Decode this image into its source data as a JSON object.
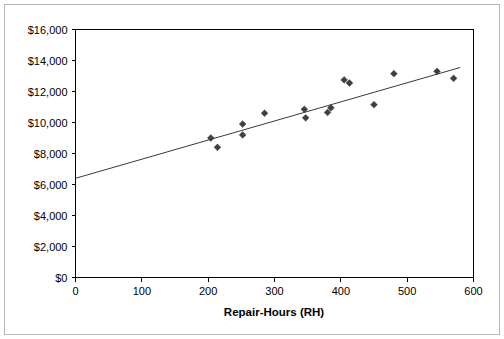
{
  "chart_data": {
    "type": "scatter",
    "title": "",
    "xlabel": "Repair-Hours (RH)",
    "ylabel": "",
    "xlim": [
      0,
      600
    ],
    "ylim": [
      0,
      16000
    ],
    "grid": false,
    "legend": null,
    "x_ticks": [
      0,
      100,
      200,
      300,
      400,
      500,
      600
    ],
    "x_tick_labels": [
      "0",
      "100",
      "200",
      "300",
      "400",
      "500",
      "600"
    ],
    "y_ticks": [
      0,
      2000,
      4000,
      6000,
      8000,
      10000,
      12000,
      14000,
      16000
    ],
    "y_tick_labels": [
      "$0",
      "$2,000",
      "$4,000",
      "$6,000",
      "$8,000",
      "$10,000",
      "$12,000",
      "$14,000",
      "$16,000"
    ],
    "marker": "diamond",
    "marker_color": "#3f3f3f",
    "points": [
      {
        "x": 204,
        "y": 9000
      },
      {
        "x": 214,
        "y": 8400
      },
      {
        "x": 252,
        "y": 9900
      },
      {
        "x": 252,
        "y": 9200
      },
      {
        "x": 285,
        "y": 10600
      },
      {
        "x": 345,
        "y": 10850
      },
      {
        "x": 347,
        "y": 10300
      },
      {
        "x": 380,
        "y": 10650
      },
      {
        "x": 385,
        "y": 10950
      },
      {
        "x": 405,
        "y": 12750
      },
      {
        "x": 413,
        "y": 12550
      },
      {
        "x": 450,
        "y": 11150
      },
      {
        "x": 480,
        "y": 13150
      },
      {
        "x": 545,
        "y": 13300
      },
      {
        "x": 570,
        "y": 12850
      }
    ],
    "trend_line": {
      "type": "linear",
      "color": "#3a3a3a",
      "x_start": 0,
      "y_start": 6400,
      "x_end": 580,
      "y_end": 13550
    }
  },
  "axes": {
    "x_title": "Repair-Hours (RH)"
  }
}
